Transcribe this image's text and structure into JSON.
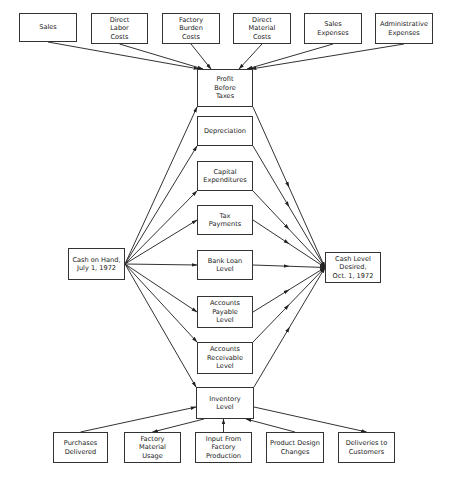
{
  "diagram": {
    "type": "flow",
    "top_inputs": [
      {
        "id": "sales",
        "label": "Sales",
        "x": 19,
        "y": 13,
        "w": 58,
        "h": 29
      },
      {
        "id": "direct-labor",
        "label": "Direct\nLabor\nCosts",
        "x": 91,
        "y": 13,
        "w": 57,
        "h": 31
      },
      {
        "id": "factory-burden",
        "label": "Factory\nBurden\nCosts",
        "x": 162,
        "y": 13,
        "w": 58,
        "h": 31
      },
      {
        "id": "direct-material",
        "label": "Direct\nMaterial\nCosts",
        "x": 233,
        "y": 13,
        "w": 58,
        "h": 31
      },
      {
        "id": "sales-expenses",
        "label": "Sales\nExpenses",
        "x": 304,
        "y": 13,
        "w": 58,
        "h": 31
      },
      {
        "id": "admin-expenses",
        "label": "Administrative\nExpenses",
        "x": 375,
        "y": 13,
        "w": 58,
        "h": 31
      }
    ],
    "middle_nodes": [
      {
        "id": "profit",
        "label": "Profit\nBefore\nTaxes",
        "x": 197,
        "y": 69,
        "w": 56,
        "h": 38
      },
      {
        "id": "depreciation",
        "label": "Depreciation",
        "x": 197,
        "y": 116,
        "w": 56,
        "h": 30
      },
      {
        "id": "capex",
        "label": "Capital\nExpenditures",
        "x": 197,
        "y": 161,
        "w": 56,
        "h": 30
      },
      {
        "id": "tax",
        "label": "Tax\nPayments",
        "x": 197,
        "y": 205,
        "w": 56,
        "h": 30
      },
      {
        "id": "bank-loan",
        "label": "Bank Loan\nLevel",
        "x": 197,
        "y": 250,
        "w": 56,
        "h": 30
      },
      {
        "id": "ap",
        "label": "Accounts\nPayable\nLevel",
        "x": 197,
        "y": 296,
        "w": 56,
        "h": 32
      },
      {
        "id": "ar",
        "label": "Accounts\nReceivable\nLevel",
        "x": 197,
        "y": 342,
        "w": 56,
        "h": 32
      },
      {
        "id": "inventory",
        "label": "Inventory\nLevel",
        "x": 196,
        "y": 387,
        "w": 58,
        "h": 32
      }
    ],
    "left_node": {
      "id": "cash-on-hand",
      "label": "Cash on Hand,\nJuly 1, 1972",
      "x": 68,
      "y": 248,
      "w": 57,
      "h": 32
    },
    "right_node": {
      "id": "cash-desired",
      "label": "Cash Level\nDesired,\nOct. 1, 1972",
      "x": 325,
      "y": 252,
      "w": 56,
      "h": 31
    },
    "bottom_nodes": [
      {
        "id": "purchases",
        "label": "Purchases\nDelivered",
        "x": 53,
        "y": 432,
        "w": 55,
        "h": 31
      },
      {
        "id": "factory-usage",
        "label": "Factory\nMaterial\nUsage",
        "x": 124,
        "y": 432,
        "w": 57,
        "h": 31
      },
      {
        "id": "factory-input",
        "label": "Input From\nFactory\nProduction",
        "x": 195,
        "y": 432,
        "w": 57,
        "h": 31
      },
      {
        "id": "design-changes",
        "label": "Product Design\nChanges",
        "x": 266,
        "y": 432,
        "w": 58,
        "h": 31
      },
      {
        "id": "deliveries",
        "label": "Deliveries to\nCustomers",
        "x": 338,
        "y": 432,
        "w": 57,
        "h": 31
      }
    ],
    "edges_note": "Top inputs -> Profit Before Taxes; Cash on Hand -> each middle node; each middle node -> Cash Level Desired; Purchases Delivered -> Inventory; Inventory -> Factory Material Usage; Factory Production -> Inventory; Product Design Changes -> Inventory; Inventory -> Deliveries to Customers"
  },
  "colors": {
    "line": "#333333",
    "box_border": "#333333",
    "text": "#222222"
  }
}
